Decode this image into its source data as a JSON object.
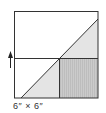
{
  "diagram": {
    "label": "6″ × 6″",
    "colors": {
      "outline": "#333333",
      "light_fill": "#e4e4e4",
      "dark_fill": "#c8c8c8",
      "stripe": "#b8b8b8"
    },
    "arrow": "up-arrow"
  }
}
